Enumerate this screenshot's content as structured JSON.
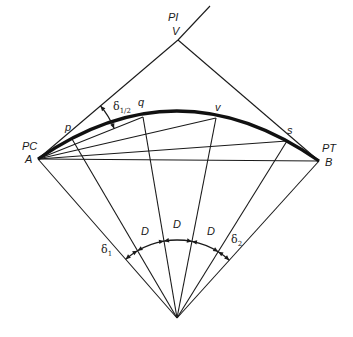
{
  "diagram": {
    "stroke_color": "#1a1a1a",
    "labels": {
      "pi": "PI",
      "v_point": "V",
      "pc": "PC",
      "a_point": "A",
      "pt": "PT",
      "b_point": "B",
      "p": "p",
      "q": "q",
      "v": "v",
      "s": "s",
      "delta_half": "δ",
      "delta_half_sub": "1/2",
      "delta1": "δ",
      "delta1_sub": "1",
      "delta2": "δ",
      "delta2_sub": "2",
      "D_left": "D",
      "D_mid": "D",
      "D_right": "D"
    },
    "arc_points": [
      "A",
      "p",
      "q",
      "v",
      "s",
      "B"
    ],
    "radial_lines_from_center": [
      "A",
      "p",
      "q",
      "v",
      "s",
      "B"
    ],
    "chords_from_A": [
      "q",
      "v",
      "s",
      "B"
    ],
    "central_angles": [
      "δ1",
      "D",
      "D",
      "D",
      "δ2"
    ]
  }
}
